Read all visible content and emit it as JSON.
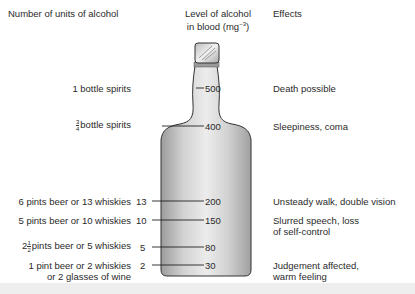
{
  "headers": {
    "units": "Number of units of alcohol",
    "level_line1": "Level of alcohol",
    "level_line2": "in blood (mg",
    "level_sup": "−3",
    "level_close": ")",
    "effects": "Effects"
  },
  "rows": [
    {
      "drinks": "1 bottle spirits",
      "units": "",
      "level": "500",
      "effect": "Death possible"
    },
    {
      "drinks_frac_num": "3",
      "drinks_frac_den": "4",
      "drinks": "bottle spirits",
      "units": "",
      "level": "400",
      "effect": "Sleepiness, coma"
    },
    {
      "drinks": "6 pints beer or 13 whiskies",
      "units": "13",
      "level": "200",
      "effect": "Unsteady walk, double vision"
    },
    {
      "drinks": "5 pints beer or 10 whiskies",
      "units": "10",
      "level": "150",
      "effect_line1": "Slurred speech, loss",
      "effect_line2": "of self-control"
    },
    {
      "drinks_whole": "2",
      "drinks_frac_num": "1",
      "drinks_frac_den": "2",
      "drinks": "pints beer or 5 whiskies",
      "units": "5",
      "level": "80",
      "effect": ""
    },
    {
      "drinks_line1": "1 pint beer or 2 whiskies",
      "drinks_line2": "or 2 glasses of wine",
      "units": "2",
      "level": "30",
      "effect_line1": "Judgement affected,",
      "effect_line2": "warm feeling"
    }
  ],
  "colors": {
    "bottle_light": "#e8e8e8",
    "bottle_dark": "#a8a8a8",
    "outline": "#333333",
    "cap_band": "#9a9a9a"
  }
}
